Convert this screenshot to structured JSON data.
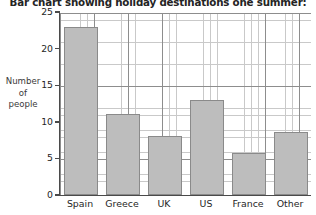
{
  "chart_data": {
    "type": "bar",
    "title": "Bar chart showing holiday destinations one summer:",
    "xlabel": "",
    "ylabel": "Number of people",
    "ylabel_lines": [
      "Number",
      "of",
      "people"
    ],
    "categories": [
      "Spain",
      "Greece",
      "UK",
      "US",
      "France",
      "Other"
    ],
    "values": [
      23,
      11,
      8,
      13,
      5.7,
      8.6
    ],
    "ylim": [
      0,
      25
    ],
    "ytick_labels": [
      "0",
      "5",
      "10",
      "15",
      "20",
      "25"
    ],
    "yticks": [
      0,
      5,
      10,
      15,
      20,
      25
    ],
    "grid": true,
    "grid_minor_step": 1,
    "grid_major_step": 5,
    "legend": null,
    "colors": {
      "bar_fill": "#bdbdbd",
      "bar_edge": "#8a8a8a",
      "axis": "#4a4a4a",
      "grid_major": "#8d8d8d",
      "grid_minor": "#c9c9c9",
      "text": "#262626"
    }
  }
}
